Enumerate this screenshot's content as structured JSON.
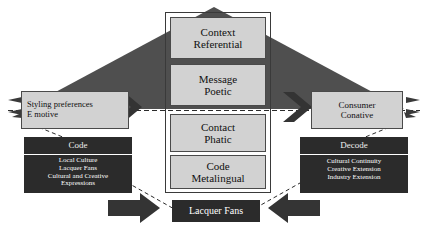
{
  "diagram": {
    "center_frame": {
      "name": "center-column-frame"
    },
    "center_boxes": [
      {
        "id": "context",
        "line1": "Context",
        "line2": "Referential"
      },
      {
        "id": "message",
        "line1": "Message",
        "line2": "Poetic"
      },
      {
        "id": "contact",
        "line1": "Contact",
        "line2": "Phatic"
      },
      {
        "id": "code",
        "line1": "Code",
        "line2": "Metalingual"
      }
    ],
    "left_panel": {
      "sender_box": {
        "line1": "Styling preferences",
        "line2": "E motive"
      },
      "dark_box": {
        "header": "Code",
        "items": [
          "Local Culture",
          "Lacquer Fans",
          "Cultural and Creative",
          "Expressions"
        ]
      }
    },
    "right_panel": {
      "receiver_box": {
        "line1": "Consumer",
        "line2": "Conative"
      },
      "dark_box": {
        "header": "Decode",
        "items": [
          "Cultural Continuity",
          "Creative Extension",
          "Industry Extension"
        ]
      }
    },
    "bottom_box": {
      "label": "Lacquer Fans"
    },
    "colors": {
      "light_fill": "#d2d2d2",
      "light_border": "#4a4a4a",
      "dark_fill": "#2b2b2b",
      "triangle_fill": "#4f4f4f",
      "arrow_fill": "#343434",
      "background": "#ffffff",
      "dashed_line": "#2b2b2b"
    },
    "connectors": {
      "chevron_left": "chevron-arrow-right-icon",
      "chevron_right": "chevron-arrow-right-icon",
      "bottom_left_arrow": "block-arrow-right-icon",
      "bottom_right_arrow": "block-arrow-left-icon",
      "edge_left_arrowheads": "small-arrowhead-left-icon",
      "edge_right_arrowheads": "small-arrowhead-right-icon",
      "horizontal_dashed": "dashed-axis-line",
      "diagonal_dashed": "dashed-connector-line"
    }
  }
}
